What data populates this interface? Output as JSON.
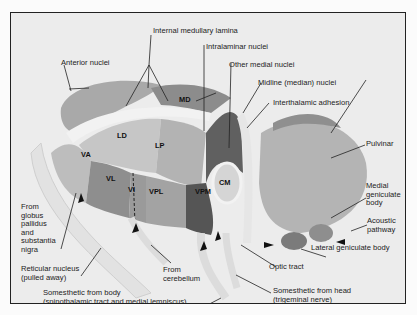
{
  "diagram": {
    "labels": {
      "internal_medullary_lamina": "Internal medullary lamina",
      "intralaminar_nuclei": "Intralaminar nuclei",
      "other_medial_nuclei": "Other medial nuclei",
      "midline_nuclei": "Midline (median) nuclei",
      "interthalamic_adhesion": "Interthalamic adhesion",
      "anterior_nuclei": "Anterior nuclei",
      "pulvinar": "Pulvinar",
      "medial_geniculate_body": [
        "Medial",
        "geniculate",
        "body"
      ],
      "acoustic_pathway": [
        "Acoustic",
        "pathway"
      ],
      "lateral_geniculate_body": "Lateral geniculate body",
      "optic_tract": "Optic tract",
      "from_globus_pallidus": [
        "From",
        "globus",
        "pallidus",
        "and",
        "substantia",
        "nigra"
      ],
      "reticular_nucleus": [
        "Reticular nucleus",
        "(pulled away)"
      ],
      "from_cerebellum": [
        "From",
        "cerebellum"
      ],
      "somesthetic_body": [
        "Somesthetic from body",
        "(spinothalamic tract and medial lemniscus)"
      ],
      "somesthetic_head": [
        "Somesthetic from head",
        "(trigeminal nerve)"
      ]
    },
    "nuclei": {
      "MD": "MD",
      "LD": "LD",
      "LP": "LP",
      "VA": "VA",
      "VL": "VL",
      "VI": "VI",
      "VPL": "VPL",
      "VPM": "VPM",
      "CM": "CM"
    }
  }
}
